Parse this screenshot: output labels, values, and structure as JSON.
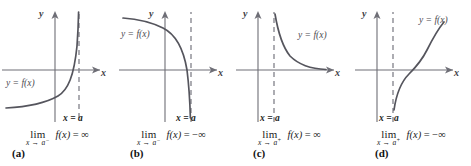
{
  "figure": {
    "colors": {
      "axis": "#6e6e76",
      "curve": "#55555d",
      "asymptote": "#8a8a92",
      "label_text": "#4c4c52",
      "strong_text": "#1b1b1b",
      "background": "#ffffff"
    },
    "panels": [
      {
        "tag": "(a)",
        "y_axis_label": "y",
        "x_axis_label": "x",
        "curve_label": "y = f(x)",
        "asymptote_label": "x = a",
        "limit": {
          "word": "lim",
          "subscript_var": "x",
          "arrow": "→",
          "subscript_target": "a",
          "side": "−",
          "body": "f(x)",
          "equals": "=",
          "result": "∞"
        },
        "behavior": "increases to +infinity as x approaches a from the left",
        "asymptote_side_of_y_axis": "right"
      },
      {
        "tag": "(b)",
        "y_axis_label": "y",
        "x_axis_label": "x",
        "curve_label": "y = f(x)",
        "asymptote_label": "x = a",
        "limit": {
          "word": "lim",
          "subscript_var": "x",
          "arrow": "→",
          "subscript_target": "a",
          "side": "−",
          "body": "f(x)",
          "equals": "=",
          "result": "−∞"
        },
        "behavior": "decreases to -infinity as x approaches a from the left",
        "asymptote_side_of_y_axis": "right"
      },
      {
        "tag": "(c)",
        "y_axis_label": "y",
        "x_axis_label": "x",
        "curve_label": "y = f(x)",
        "asymptote_label": "x = a",
        "limit": {
          "word": "lim",
          "subscript_var": "x",
          "arrow": "→",
          "subscript_target": "a",
          "side": "+",
          "body": "f(x)",
          "equals": "=",
          "result": "∞"
        },
        "behavior": "increases to +infinity as x approaches a from the right",
        "asymptote_side_of_y_axis": "right-of-y-axis-near"
      },
      {
        "tag": "(d)",
        "y_axis_label": "y",
        "x_axis_label": "x",
        "curve_label": "y = f(x)",
        "asymptote_label": "x = a",
        "limit": {
          "word": "lim",
          "subscript_var": "x",
          "arrow": "→",
          "subscript_target": "a",
          "side": "+",
          "body": "f(x)",
          "equals": "=",
          "result": "−∞"
        },
        "behavior": "decreases to -infinity as x approaches a from the right",
        "asymptote_side_of_y_axis": "right-of-y-axis-near"
      }
    ]
  }
}
